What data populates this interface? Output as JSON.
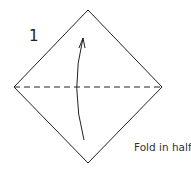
{
  "diagram": {
    "step": {
      "number": "1",
      "instruction": "Fold in half."
    },
    "paper": {
      "shape": "square-diamond",
      "top": [
        88,
        10
      ],
      "right": [
        162,
        87
      ],
      "bottom": [
        88,
        163
      ],
      "left": [
        14,
        87
      ],
      "stroke_color": "#222222"
    },
    "fold_line": {
      "type": "valley-fold-dashed",
      "from": [
        14,
        87
      ],
      "to": [
        162,
        87
      ],
      "dash": "6 4"
    },
    "arrow": {
      "direction": "up",
      "meaning": "fold bottom corner up to top corner",
      "start": [
        84,
        140
      ],
      "control": [
        70,
        88
      ],
      "end": [
        83,
        38
      ]
    },
    "colors": {
      "background": "#ffffff",
      "line": "#222222",
      "text": "#333333"
    }
  }
}
